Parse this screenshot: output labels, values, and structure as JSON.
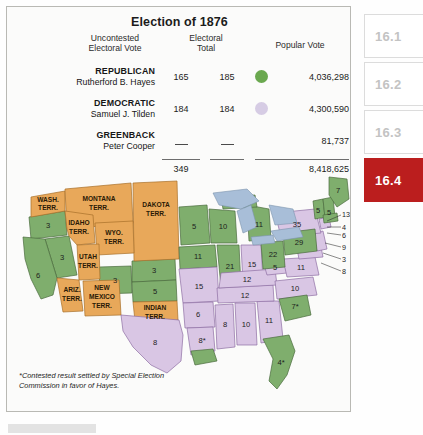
{
  "figure": {
    "title": "Election of 1876",
    "columns": {
      "uncontested": "Uncontested\nElectoral Vote",
      "uncontested_line1": "Uncontested",
      "uncontested_line2": "Electoral Vote",
      "electoral_line1": "Electoral",
      "electoral_line2": "Total",
      "popular": "Popular Vote"
    },
    "parties": [
      {
        "party": "REPUBLICAN",
        "candidate": "Rutherford B. Hayes",
        "uncontested": "165",
        "electoral_total": "185",
        "popular_vote": "4,036,298",
        "color": "#6aa84f"
      },
      {
        "party": "DEMOCRATIC",
        "candidate": "Samuel J. Tilden",
        "uncontested": "184",
        "electoral_total": "184",
        "popular_vote": "4,300,590",
        "color": "#d6cce4"
      },
      {
        "party": "GREENBACK",
        "candidate": "Peter Cooper",
        "uncontested": "—",
        "electoral_total": "—",
        "popular_vote": "81,737",
        "color": "none"
      }
    ],
    "totals": {
      "uncontested": "349",
      "electoral_total": "",
      "popular_vote": "8,418,625"
    },
    "footnote": "*Contested result settled by Special Election Commission in favor of Hayes."
  },
  "map": {
    "legend_colors": {
      "republican_green": "#7fae6d",
      "democratic_purple": "#d9c6e4",
      "territory_orange": "#e8a85a",
      "water_blue": "#a8bed8"
    },
    "territories": [
      {
        "name": "WASH.\nTERR.",
        "line1": "WASH.",
        "line2": "TERR."
      },
      {
        "name": "MONTANA\nTERR.",
        "line1": "MONTANA",
        "line2": "TERR."
      },
      {
        "name": "DAKOTA\nTERR.",
        "line1": "DAKOTA",
        "line2": "TERR."
      },
      {
        "name": "IDAHO\nTERR.",
        "line1": "IDAHO",
        "line2": "TERR."
      },
      {
        "name": "WYO.\nTERR.",
        "line1": "WYO.",
        "line2": "TERR."
      },
      {
        "name": "UTAH\nTERR.",
        "line1": "UTAH",
        "line2": "TERR."
      },
      {
        "name": "ARIZ.\nTERR.",
        "line1": "ARIZ.",
        "line2": "TERR."
      },
      {
        "name": "NEW\nMEXICO\nTERR.",
        "line1": "NEW",
        "line2": "MEXICO",
        "line3": "TERR."
      },
      {
        "name": "INDIAN\nTERR.",
        "line1": "INDIAN",
        "line2": "TERR."
      }
    ],
    "state_votes": [
      {
        "state": "Oregon",
        "value": "3",
        "party": "republican"
      },
      {
        "state": "Nevada",
        "value": "3",
        "party": "republican"
      },
      {
        "state": "California",
        "value": "6",
        "party": "republican"
      },
      {
        "state": "Colorado",
        "value": "3",
        "party": "republican"
      },
      {
        "state": "Nebraska",
        "value": "3",
        "party": "republican"
      },
      {
        "state": "Kansas",
        "value": "5",
        "party": "republican"
      },
      {
        "state": "Minnesota",
        "value": "5",
        "party": "republican"
      },
      {
        "state": "Iowa",
        "value": "11",
        "party": "republican"
      },
      {
        "state": "Wisconsin",
        "value": "10",
        "party": "republican"
      },
      {
        "state": "Michigan",
        "value": "11",
        "party": "republican"
      },
      {
        "state": "Illinois",
        "value": "21",
        "party": "republican"
      },
      {
        "state": "Indiana",
        "value": "15",
        "party": "democratic"
      },
      {
        "state": "Missouri",
        "value": "15",
        "party": "democratic"
      },
      {
        "state": "Ohio",
        "value": "22",
        "party": "republican"
      },
      {
        "state": "Pennsylvania",
        "value": "29",
        "party": "republican"
      },
      {
        "state": "New York",
        "value": "35",
        "party": "democratic"
      },
      {
        "state": "Maine",
        "value": "7",
        "party": "republican"
      },
      {
        "state": "Vermont",
        "value": "5",
        "party": "republican"
      },
      {
        "state": "New Hampshire",
        "value": "5",
        "party": "republican"
      },
      {
        "state": "Kentucky",
        "value": "12",
        "party": "democratic"
      },
      {
        "state": "Tennessee",
        "value": "12",
        "party": "democratic"
      },
      {
        "state": "West Virginia",
        "value": "5",
        "party": "democratic"
      },
      {
        "state": "Virginia",
        "value": "11",
        "party": "democratic"
      },
      {
        "state": "North Carolina",
        "value": "10",
        "party": "democratic"
      },
      {
        "state": "Arkansas",
        "value": "6",
        "party": "democratic"
      },
      {
        "state": "Mississippi",
        "value": "8",
        "party": "democratic"
      },
      {
        "state": "Alabama",
        "value": "10",
        "party": "democratic"
      },
      {
        "state": "Georgia",
        "value": "11",
        "party": "democratic"
      },
      {
        "state": "Texas",
        "value": "8",
        "party": "democratic"
      },
      {
        "state": "Louisiana",
        "value": "8*",
        "party": "republican-contested"
      },
      {
        "state": "South Carolina",
        "value": "7*",
        "party": "republican-contested"
      },
      {
        "state": "Florida",
        "value": "4*",
        "party": "republican-contested"
      }
    ],
    "callout_values": [
      "13",
      "4",
      "6",
      "9",
      "3",
      "8"
    ]
  },
  "sidebar": {
    "items": [
      {
        "label": "16.1",
        "active": false
      },
      {
        "label": "16.2",
        "active": false
      },
      {
        "label": "16.3",
        "active": false
      },
      {
        "label": "16.4",
        "active": true
      }
    ]
  }
}
